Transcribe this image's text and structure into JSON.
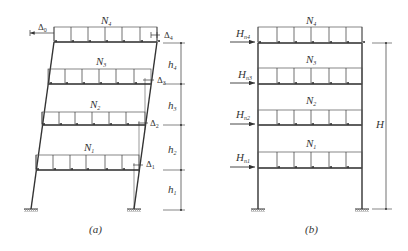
{
  "figure": {
    "panel_a": {
      "caption": "(a)",
      "loads": [
        {
          "name": "N",
          "sub": "4"
        },
        {
          "name": "N",
          "sub": "3"
        },
        {
          "name": "N",
          "sub": "2"
        },
        {
          "name": "N",
          "sub": "1"
        }
      ],
      "displacements": [
        {
          "name": "Δ",
          "sub": "0"
        },
        {
          "name": "Δ",
          "sub": "4"
        },
        {
          "name": "Δ",
          "sub": "3"
        },
        {
          "name": "Δ",
          "sub": "2"
        },
        {
          "name": "Δ",
          "sub": "1"
        }
      ],
      "storey_heights": [
        {
          "name": "h",
          "sub": "4"
        },
        {
          "name": "h",
          "sub": "3"
        },
        {
          "name": "h",
          "sub": "2"
        },
        {
          "name": "h",
          "sub": "1"
        }
      ]
    },
    "panel_b": {
      "caption": "(b)",
      "loads": [
        {
          "name": "N",
          "sub": "4"
        },
        {
          "name": "N",
          "sub": "3"
        },
        {
          "name": "N",
          "sub": "2"
        },
        {
          "name": "N",
          "sub": "1"
        }
      ],
      "horizontal_forces": [
        {
          "name": "H",
          "sub": "n4"
        },
        {
          "name": "H",
          "sub": "n3"
        },
        {
          "name": "H",
          "sub": "n2"
        },
        {
          "name": "H",
          "sub": "n1"
        }
      ],
      "total_height": "H"
    },
    "colors": {
      "line": "#333333",
      "background": "#ffffff"
    }
  }
}
